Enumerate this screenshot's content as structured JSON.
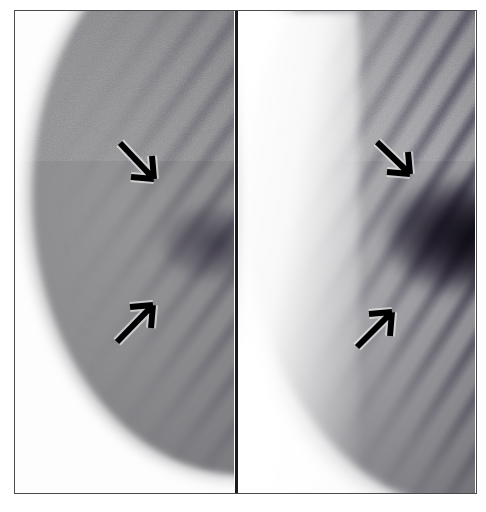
{
  "figure": {
    "type": "two-panel grayscale radiographic image pair",
    "frame": {
      "border_color": "#4a4a4e",
      "background_color": "#ffffff",
      "divider_color": "#1b1b1f"
    },
    "caption": "",
    "panels": [
      {
        "id": "panel-left",
        "position": "left",
        "label": "",
        "description": "Lower-contrast grayscale image showing a convex soft-tissue mass entering from the upper right with fine diagonal striations; boundary is smooth and curved.",
        "tissue_tone": "#8e8e92",
        "background_tone": "#fdfdfd",
        "striation_angle_deg": 126,
        "annotations": [
          {
            "id": "arrow-upper-left",
            "icon": "arrow-icon",
            "direction": "down-right",
            "tail": [
              120,
              143
            ],
            "head": [
              154,
              179
            ],
            "points_to": "superficial striated band at the upper margin"
          },
          {
            "id": "arrow-lower-left",
            "icon": "arrow-icon",
            "direction": "up-right",
            "tail": [
              117,
              340
            ],
            "head": [
              153,
              303
            ],
            "points_to": "deeper striated band at the lower margin"
          }
        ]
      },
      {
        "id": "panel-right",
        "position": "right",
        "label": "",
        "description": "Higher-contrast grayscale image of the same region; the striated banding is darker and more pronounced with a dense hypoechoic focus toward the right edge.",
        "tissue_tone": "#6e6e74",
        "background_tone": "#ffffff",
        "striation_angle_deg": 122,
        "annotations": [
          {
            "id": "arrow-upper-right",
            "icon": "arrow-icon",
            "direction": "down-right",
            "tail": [
              377,
              142
            ],
            "head": [
              410,
              174
            ],
            "points_to": "superficial striated band at the upper margin"
          },
          {
            "id": "arrow-lower-right",
            "icon": "arrow-icon",
            "direction": "up-right",
            "tail": [
              357,
              347
            ],
            "head": [
              392,
              312
            ],
            "points_to": "deeper striated band at the lower margin"
          }
        ]
      }
    ]
  }
}
